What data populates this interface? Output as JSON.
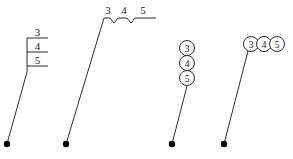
{
  "figure": {
    "background_color": "#ffffff",
    "stroke_color": "#2b2b2b",
    "text_color": "#1a1a1a",
    "width": 293,
    "height": 159,
    "variants": [
      {
        "name": "stacked-box-callout",
        "style": "vertical stacked boxes with horizontal dividers",
        "labels": [
          "3",
          "4",
          "5"
        ],
        "anchor_dot": {
          "x": 7,
          "y": 144
        },
        "leader_from": {
          "x": 7,
          "y": 144
        },
        "leader_to": {
          "x": 27,
          "y": 72
        },
        "box": {
          "x": 27,
          "y": 30,
          "width": 21,
          "height": 42
        }
      },
      {
        "name": "zigzag-inline-callout",
        "style": "horizontal zigzag baseline with numbers above",
        "labels": [
          "3",
          "4",
          "5"
        ],
        "anchor_dot": {
          "x": 66,
          "y": 144
        },
        "leader_from": {
          "x": 66,
          "y": 144
        },
        "leader_to": {
          "x": 104,
          "y": 18
        },
        "baseline": {
          "x_start": 104,
          "x_end": 156,
          "y": 18
        }
      },
      {
        "name": "vertical-circles-callout",
        "style": "vertically stacked circles",
        "labels": [
          "3",
          "4",
          "5"
        ],
        "anchor_dot": {
          "x": 172,
          "y": 144
        },
        "leader_from": {
          "x": 172,
          "y": 144
        },
        "leader_to": {
          "x": 187,
          "y": 92
        },
        "circle_radius": 7.5,
        "circle_centers": [
          {
            "x": 187,
            "y": 48
          },
          {
            "x": 187,
            "y": 63
          },
          {
            "x": 187,
            "y": 78
          }
        ]
      },
      {
        "name": "horizontal-circles-callout",
        "style": "horizontally arranged circles",
        "labels": [
          "3",
          "4",
          "5"
        ],
        "anchor_dot": {
          "x": 224,
          "y": 144
        },
        "leader_from": {
          "x": 224,
          "y": 144
        },
        "leader_to": {
          "x": 248,
          "y": 51
        },
        "circle_radius": 7.5,
        "circle_centers": [
          {
            "x": 251,
            "y": 44
          },
          {
            "x": 264,
            "y": 44
          },
          {
            "x": 277,
            "y": 44
          }
        ]
      }
    ]
  }
}
